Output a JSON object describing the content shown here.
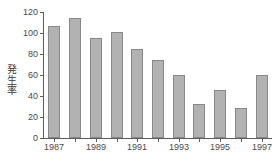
{
  "chart_data": {
    "type": "bar",
    "title": "",
    "subtitle": "",
    "xlabel": "",
    "ylabel": "発生率",
    "ylabel_chars": [
      "発",
      "生",
      "率"
    ],
    "categories": [
      "1987",
      "1988",
      "1989",
      "1990",
      "1991",
      "1992",
      "1993",
      "1994",
      "1995",
      "1996",
      "1997"
    ],
    "values": [
      107,
      114,
      95,
      101,
      85,
      74,
      60,
      32,
      46,
      29,
      60
    ],
    "xtick_labels": [
      "1987",
      "1989",
      "1991",
      "1993",
      "1995",
      "1997"
    ],
    "xtick_categories": [
      "1987",
      "1989",
      "1991",
      "1993",
      "1995",
      "1997"
    ],
    "ytick_labels": [
      "0",
      "20",
      "40",
      "60",
      "80",
      "100",
      "120"
    ],
    "ytick_values": [
      0,
      20,
      40,
      60,
      80,
      100,
      120
    ],
    "ylim": [
      0,
      120
    ],
    "grid": false,
    "legend": null,
    "legend_position": "none",
    "bar_color": "#b2b2b2",
    "bar_border_color": "#888888",
    "axis_color": "#5d5d5d",
    "text_color": "#4a4a4a",
    "background": "#ffffff"
  }
}
